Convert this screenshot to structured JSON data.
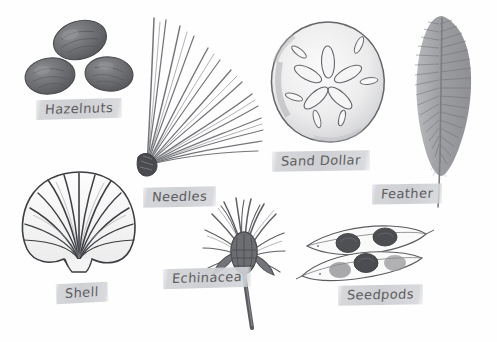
{
  "page": {
    "background_color": "#fefefe",
    "width": 497,
    "height": 342,
    "style": "hand-drawn pencil and watercolor nature journal",
    "label_chip_color": "#d2d3d6",
    "label_text_color": "#5d5d60",
    "ink_color": "#4a4a4d"
  },
  "specimens": [
    {
      "id": "hazelnuts",
      "label": "Hazelnuts",
      "icon": "hazelnuts-icon",
      "count": 3,
      "fill_color": "#6f7073",
      "description": "three dark oval nuts arranged in a triangle",
      "label_x": 36,
      "label_y": 99,
      "label_rotate": -1.5
    },
    {
      "id": "needles",
      "label": "Needles",
      "icon": "pine-needles-icon",
      "count": 1,
      "fill_color": "#6b6c70",
      "description": "fan of long pine needles bound at a dark base",
      "label_x": 143,
      "label_y": 187,
      "label_rotate": -1
    },
    {
      "id": "sand-dollar",
      "label": "Sand Dollar",
      "icon": "sand-dollar-icon",
      "count": 1,
      "fill_color": "#c9cacd",
      "description": "round sand dollar with five petal pattern",
      "label_x": 272,
      "label_y": 151,
      "label_rotate": -1
    },
    {
      "id": "feather",
      "label": "Feather",
      "icon": "feather-icon",
      "count": 1,
      "fill_color": "#8c8d91",
      "description": "single grey plume feather with long quill",
      "label_x": 372,
      "label_y": 184,
      "label_rotate": -1
    },
    {
      "id": "shell",
      "label": "Shell",
      "icon": "scallop-shell-icon",
      "count": 1,
      "fill_color": "#f2f2f3",
      "description": "scallop shell with radiating ribs",
      "label_x": 56,
      "label_y": 283,
      "label_rotate": -3
    },
    {
      "id": "echinacea",
      "label": "Echinacea",
      "icon": "echinacea-icon",
      "count": 1,
      "fill_color": "#6d6e72",
      "description": "dried coneflower head on a tall stem",
      "label_x": 163,
      "label_y": 268,
      "label_rotate": -1.5
    },
    {
      "id": "seedpods",
      "label": "Seedpods",
      "icon": "seedpods-icon",
      "count": 2,
      "fill_color": "#f0f0f1",
      "description": "two open pods showing dark round seeds",
      "label_x": 338,
      "label_y": 285,
      "label_rotate": -1
    }
  ]
}
